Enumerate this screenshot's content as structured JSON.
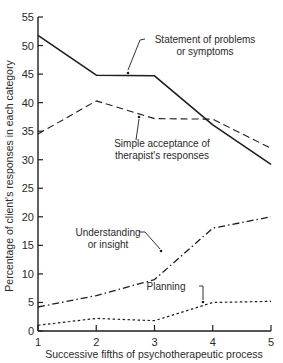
{
  "chart_data": {
    "type": "line",
    "title": "",
    "xlabel": "Successive fifths of psychotherapeutic process",
    "ylabel": "Percentage of client's responses in each category",
    "x": [
      1,
      2,
      3,
      4,
      5
    ],
    "xlim": [
      1,
      5
    ],
    "ylim": [
      0,
      55
    ],
    "xticks": [
      "1",
      "2",
      "3",
      "4",
      "5"
    ],
    "yticks": [
      "0",
      "5",
      "10",
      "15",
      "20",
      "25",
      "30",
      "35",
      "40",
      "45",
      "50",
      "55"
    ],
    "grid": false,
    "legend": "inline annotations with leader arrows",
    "series": [
      {
        "name": "Statement of problems or symptoms",
        "label_lines": [
          "Statement of problems",
          "or symptoms"
        ],
        "style": "solid",
        "values": [
          51.8,
          44.8,
          44.7,
          36.1,
          29.2
        ]
      },
      {
        "name": "Simple acceptance of therapist's responses",
        "label_lines": [
          "Simple acceptance of",
          "therapist's responses"
        ],
        "style": "dashed",
        "values": [
          34.5,
          40.3,
          37.2,
          37.1,
          32.0
        ]
      },
      {
        "name": "Understanding or insight",
        "label_lines": [
          "Understanding",
          "or insight"
        ],
        "style": "dash-dot",
        "values": [
          4.2,
          6.2,
          9.0,
          18.0,
          20.0
        ]
      },
      {
        "name": "Planning",
        "label_lines": [
          "Planning"
        ],
        "style": "dotted",
        "values": [
          1.0,
          2.2,
          1.8,
          5.0,
          5.2
        ]
      }
    ]
  },
  "colors": {
    "line": "#1e1e1e",
    "text": "#2a2a2a",
    "background": "#ffffff"
  }
}
